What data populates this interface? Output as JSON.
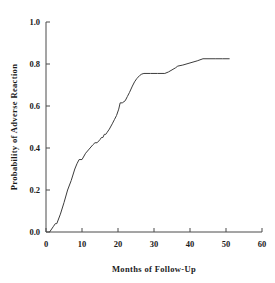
{
  "chart_data": {
    "type": "line",
    "title": "",
    "xlabel": "Months of Follow-Up",
    "ylabel": "Probability of Adverse Reaction",
    "xlim": [
      0,
      60
    ],
    "ylim": [
      0.0,
      1.0
    ],
    "xticks": [
      0,
      10,
      20,
      30,
      40,
      50,
      60
    ],
    "xtick_labels": [
      "0",
      "10",
      "20",
      "30",
      "40",
      "50",
      "60"
    ],
    "yticks": [
      0.0,
      0.2,
      0.4,
      0.6,
      0.8,
      1.0
    ],
    "ytick_labels": [
      "0.0",
      "0.2",
      "0.4",
      "0.6",
      "0.8",
      "1.0"
    ],
    "grid": false,
    "legend": "none",
    "series": [
      {
        "name": "Cumulative probability of adverse reaction",
        "color": "#3c3c3c",
        "x": [
          1.0,
          2.0,
          2.6,
          3.0,
          4.0,
          5.0,
          6.0,
          7.0,
          8.0,
          8.6,
          9.2,
          10.0,
          11.0,
          12.0,
          13.0,
          13.6,
          14.2,
          15.0,
          15.4,
          15.8,
          16.2,
          16.6,
          17.0,
          17.6,
          18.4,
          19.0,
          19.6,
          20.2,
          20.6,
          21.2,
          22.0,
          22.6,
          23.2,
          24.0,
          24.6,
          25.2,
          26.0,
          26.6,
          27.2,
          29.0,
          31.0,
          33.0,
          34.0,
          35.0,
          36.0,
          36.6,
          38.0,
          40.0,
          42.0,
          43.6,
          45.0,
          47.0,
          49.0,
          51.0
        ],
        "y": [
          0.0,
          0.025,
          0.04,
          0.04,
          0.085,
          0.14,
          0.2,
          0.245,
          0.3,
          0.325,
          0.345,
          0.345,
          0.375,
          0.395,
          0.415,
          0.425,
          0.425,
          0.44,
          0.45,
          0.45,
          0.465,
          0.465,
          0.475,
          0.49,
          0.515,
          0.535,
          0.555,
          0.585,
          0.615,
          0.615,
          0.625,
          0.645,
          0.665,
          0.695,
          0.715,
          0.73,
          0.745,
          0.752,
          0.755,
          0.755,
          0.755,
          0.755,
          0.762,
          0.772,
          0.782,
          0.79,
          0.795,
          0.805,
          0.815,
          0.825,
          0.825,
          0.825,
          0.825,
          0.825
        ]
      }
    ]
  },
  "axis": {
    "x_title": "Months of Follow-Up",
    "y_title": "Probability of Adverse Reaction"
  }
}
